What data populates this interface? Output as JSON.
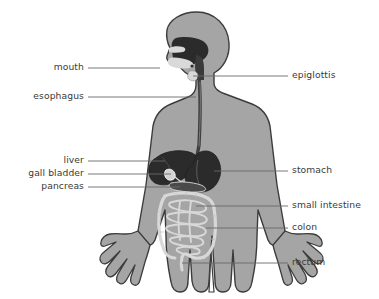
{
  "diagram": {
    "background_color": "#ffffff",
    "body_fill": "#a5a5a5",
    "body_outline": "#3c3c3c",
    "organ_dark": "#2b2b2b",
    "organ_mid": "#6e6e6e",
    "organ_light": "#d9d9d9",
    "leader_line_color": "#6a6a6a",
    "text_color": "#3a3a3a"
  },
  "labels_left": [
    {
      "id": "mouth",
      "text": "mouth",
      "text_x": 44,
      "text_y": 62,
      "line_x1": 88,
      "line_x2": 160,
      "line_y": 68,
      "target_x": 160,
      "target_y": 68
    },
    {
      "id": "esophagus",
      "text": "esophagus",
      "text_x": 22,
      "text_y": 91,
      "line_x1": 88,
      "line_x2": 196,
      "line_y": 97,
      "target_x": 196,
      "target_y": 97
    },
    {
      "id": "liver",
      "text": "liver",
      "text_x": 58,
      "text_y": 155,
      "line_x1": 88,
      "line_x2": 165,
      "line_y": 161,
      "target_x": 165,
      "target_y": 161
    },
    {
      "id": "gall-bladder",
      "text": "gall bladder",
      "text_x": 20,
      "text_y": 168,
      "line_x1": 88,
      "line_x2": 171,
      "line_y": 174,
      "target_x": 171,
      "target_y": 174
    },
    {
      "id": "pancreas",
      "text": "pancreas",
      "text_x": 31,
      "text_y": 181,
      "line_x1": 88,
      "line_x2": 180,
      "line_y": 187,
      "target_x": 180,
      "target_y": 187
    }
  ],
  "labels_right": [
    {
      "id": "epiglottis",
      "text": "epiglottis",
      "text_x": 292,
      "text_y": 70,
      "line_x1": 193,
      "line_x2": 288,
      "line_y": 76,
      "target_x": 193,
      "target_y": 76
    },
    {
      "id": "stomach",
      "text": "stomach",
      "text_x": 292,
      "text_y": 165,
      "line_x1": 214,
      "line_x2": 288,
      "line_y": 171,
      "target_x": 214,
      "target_y": 171
    },
    {
      "id": "small-intestine",
      "text": "small intestine",
      "text_x": 292,
      "text_y": 200,
      "line_x1": 196,
      "line_x2": 288,
      "line_y": 206,
      "target_x": 196,
      "target_y": 206
    },
    {
      "id": "colon",
      "text": "colon",
      "text_x": 292,
      "text_y": 222,
      "line_x1": 206,
      "line_x2": 288,
      "line_y": 228,
      "target_x": 206,
      "target_y": 228
    },
    {
      "id": "rectum",
      "text": "rectum",
      "text_x": 292,
      "text_y": 257,
      "line_x1": 182,
      "line_x2": 288,
      "line_y": 263,
      "target_x": 182,
      "target_y": 263
    }
  ]
}
